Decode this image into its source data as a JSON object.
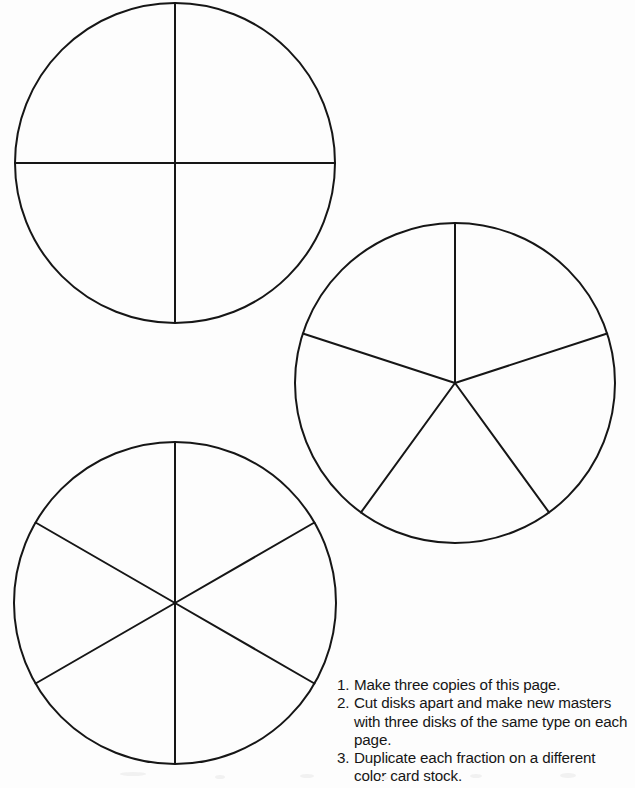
{
  "document": {
    "title": "Fraction Disks Master",
    "background_color": "#fdfdfd",
    "ink_color": "#161616",
    "width": 635,
    "height": 788
  },
  "figures": {
    "stroke_color": "#161616",
    "stroke_width": 2,
    "fill_color": "none",
    "disks": [
      {
        "name": "fourths-disk",
        "label": "Disk divided into fourths",
        "denominator": 4,
        "cx": 175,
        "cy": 163,
        "r": 160,
        "rotation_deg": 0,
        "sector_angle_deg": 90
      },
      {
        "name": "fifths-disk",
        "label": "Disk divided into fifths",
        "denominator": 5,
        "cx": 455,
        "cy": 383,
        "r": 160,
        "rotation_deg": 0,
        "sector_angle_deg": 72
      },
      {
        "name": "sixths-disk",
        "label": "Disk divided into sixths",
        "denominator": 6,
        "cx": 175,
        "cy": 603,
        "r": 161,
        "rotation_deg": 0,
        "sector_angle_deg": 60
      }
    ]
  },
  "instructions": {
    "items": [
      {
        "number": "1.",
        "text": "Make three copies of this page."
      },
      {
        "number": "2.",
        "text": "Cut disks apart and make new masters with three disks of the same type on each page."
      },
      {
        "number": "3.",
        "text": "Duplicate each fraction on a different color card stock."
      }
    ]
  }
}
